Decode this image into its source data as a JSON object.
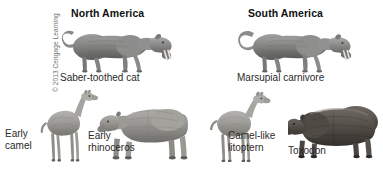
{
  "figure": {
    "title_north": "North America",
    "title_south": "South America",
    "credit": "© 2013 Cengage Learning",
    "background_color": "#ffffff",
    "ink_color": "#6b6b6b"
  },
  "columns": [
    {
      "key": "north",
      "label": "North America"
    },
    {
      "key": "south",
      "label": "South America"
    }
  ],
  "specimens": [
    {
      "id": "saber-toothed-cat",
      "caption": "Saber-toothed cat",
      "continent": "North America",
      "row": "top",
      "icon": "saber-toothed-cat-illustration"
    },
    {
      "id": "marsupial-carnivore",
      "caption": "Marsupial carnivore",
      "continent": "South America",
      "row": "top",
      "icon": "marsupial-carnivore-illustration"
    },
    {
      "id": "early-camel",
      "caption": "Early\ncamel",
      "continent": "North America",
      "row": "bottom",
      "icon": "early-camel-illustration"
    },
    {
      "id": "early-rhinoceros",
      "caption": "Early\nrhinoceros",
      "continent": "North America",
      "row": "bottom",
      "icon": "early-rhinoceros-illustration"
    },
    {
      "id": "camel-like-litoptern",
      "caption": "Camel-like\nlitoptern",
      "continent": "South America",
      "row": "bottom",
      "icon": "camel-like-litoptern-illustration"
    },
    {
      "id": "toxodon",
      "caption": "Toxodon",
      "continent": "South America",
      "row": "bottom",
      "icon": "toxodon-illustration"
    }
  ]
}
